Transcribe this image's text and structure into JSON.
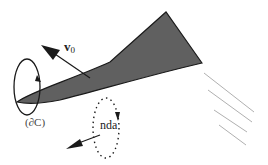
{
  "figure": {
    "labels": {
      "velocity_main": "v",
      "velocity_sub": "0",
      "boundary": "(∂C)",
      "normal_element": "nda"
    },
    "colors": {
      "wedge_fill": "#606060",
      "wedge_edge": "#1a1a1a",
      "stroke": "#1a1a1a",
      "streamlines": "#b0b0b0",
      "background": "#ffffff"
    }
  }
}
